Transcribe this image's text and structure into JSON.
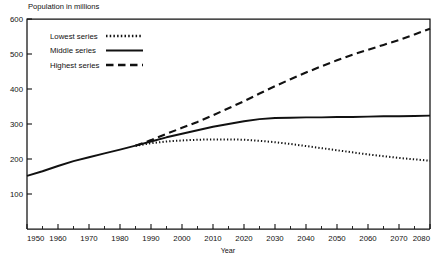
{
  "chart_data": {
    "type": "line",
    "title": "",
    "subtitle": "",
    "ylabel": "Population in millions",
    "xlabel": "Year",
    "xlim": [
      1950,
      2080
    ],
    "ylim": [
      0,
      600
    ],
    "grid": false,
    "legend_position": "top-left-inside",
    "x_ticks": [
      1950,
      1960,
      1970,
      1980,
      1990,
      2000,
      2010,
      2020,
      2030,
      2040,
      2050,
      2060,
      2070,
      2080
    ],
    "x_tick_labels": [
      "1950",
      "1960",
      "1970",
      "1980",
      "1990",
      "2000",
      "2010",
      "2020",
      "2030",
      "2040",
      "2050",
      "2060",
      "2070",
      "2080"
    ],
    "x_minor_ticks": [
      1955,
      1965,
      1975,
      1985,
      1995,
      2005,
      2015,
      2025,
      2035,
      2045,
      2055,
      2065,
      2075
    ],
    "y_ticks": [
      0,
      100,
      200,
      300,
      400,
      500,
      600
    ],
    "y_tick_labels": [
      "",
      "100",
      "200",
      "300",
      "400",
      "500",
      "600"
    ],
    "series": [
      {
        "name": "Historical",
        "style": "solid",
        "legend": false,
        "x": [
          1950,
          1955,
          1960,
          1965,
          1970,
          1975,
          1980,
          1985
        ],
        "values": [
          152,
          165,
          180,
          194,
          205,
          216,
          227,
          238
        ]
      },
      {
        "name": "Lowest series",
        "style": "dotted",
        "legend": true,
        "x": [
          1985,
          1990,
          1995,
          2000,
          2005,
          2010,
          2015,
          2020,
          2025,
          2030,
          2035,
          2040,
          2045,
          2050,
          2055,
          2060,
          2065,
          2070,
          2075,
          2080
        ],
        "values": [
          238,
          245,
          250,
          253,
          255,
          256,
          256,
          255,
          252,
          248,
          243,
          237,
          231,
          225,
          219,
          213,
          208,
          203,
          199,
          195
        ]
      },
      {
        "name": "Middle series",
        "style": "solid",
        "legend": true,
        "x": [
          1985,
          1990,
          1995,
          2000,
          2005,
          2010,
          2015,
          2020,
          2025,
          2030,
          2035,
          2040,
          2045,
          2050,
          2055,
          2060,
          2065,
          2070,
          2075,
          2080
        ],
        "values": [
          238,
          250,
          262,
          272,
          282,
          292,
          300,
          308,
          314,
          317,
          318,
          319,
          319,
          320,
          320,
          321,
          322,
          322,
          323,
          324
        ]
      },
      {
        "name": "Highest series",
        "style": "dashed",
        "legend": true,
        "x": [
          1985,
          1990,
          1995,
          2000,
          2005,
          2010,
          2015,
          2020,
          2025,
          2030,
          2035,
          2040,
          2045,
          2050,
          2055,
          2060,
          2065,
          2070,
          2075,
          2080
        ],
        "values": [
          238,
          254,
          272,
          289,
          306,
          325,
          345,
          365,
          387,
          408,
          428,
          447,
          465,
          482,
          498,
          512,
          526,
          540,
          556,
          572
        ]
      }
    ],
    "legend_entries": [
      {
        "label": "Lowest series",
        "style": "dotted"
      },
      {
        "label": "Middle series",
        "style": "solid"
      },
      {
        "label": "Highest series",
        "style": "dashed"
      }
    ]
  }
}
